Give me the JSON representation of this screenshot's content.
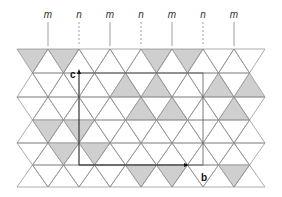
{
  "symmetry_labels": [
    "m",
    "n",
    "m",
    "n",
    "m",
    "n",
    "m"
  ],
  "symmetry_line_styles": [
    "solid",
    "dashed",
    "solid",
    "dashed",
    "solid",
    "dashed",
    "solid"
  ],
  "axes": {
    "c_label": "c",
    "b_label": "b"
  },
  "colors": {
    "shade": "#cfcfcf",
    "edge": "#8a8a8a",
    "axis": "#333333",
    "background": "#ffffff"
  },
  "lattice": {
    "columns": 17,
    "rows": 6,
    "shaded": [
      [
        0,
        0
      ],
      [
        2,
        0
      ],
      [
        8,
        0
      ],
      [
        10,
        0
      ],
      [
        6,
        1
      ],
      [
        8,
        1
      ],
      [
        12,
        1
      ],
      [
        14,
        1
      ],
      [
        7,
        2
      ],
      [
        9,
        2
      ],
      [
        13,
        2
      ],
      [
        15,
        2
      ],
      [
        1,
        3
      ],
      [
        3,
        3
      ],
      [
        2,
        4
      ],
      [
        4,
        4
      ],
      [
        7,
        5
      ],
      [
        9,
        5
      ],
      [
        13,
        5
      ],
      [
        15,
        5
      ]
    ]
  }
}
